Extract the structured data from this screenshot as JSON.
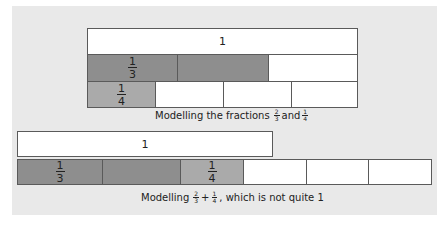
{
  "figure1": {
    "whole_label": "1",
    "thirds_label_num": "1",
    "thirds_label_den": "3",
    "quarters_label_num": "1",
    "quarters_label_den": "4",
    "caption_prefix": "Modelling the fractions",
    "caption_f1_num": "2",
    "caption_f1_den": "3",
    "caption_and": "and",
    "caption_f2_num": "1",
    "caption_f2_den": "4"
  },
  "figure2": {
    "whole_label": "1",
    "third_num": "1",
    "third_den": "3",
    "quarter_num": "1",
    "quarter_den": "4",
    "caption_prefix": "Modelling",
    "caption_f1_num": "2",
    "caption_f1_den": "3",
    "caption_plus": "+",
    "caption_f2_num": "1",
    "caption_f2_den": "4",
    "caption_suffix": ", which is not quite 1"
  },
  "colors": {
    "background": "#e9e9e9",
    "shaded_third": "#8e8e8e",
    "shaded_quarter": "#aaaaaa",
    "border": "#5a5a5a"
  }
}
